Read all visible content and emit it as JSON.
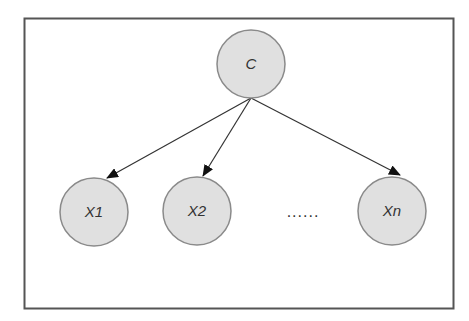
{
  "diagram": {
    "type": "bayesian-network",
    "nodes": [
      {
        "id": "C",
        "label": "C",
        "role": "parent"
      },
      {
        "id": "X1",
        "label": "X1",
        "role": "child"
      },
      {
        "id": "X2",
        "label": "X2",
        "role": "child"
      },
      {
        "id": "Xn",
        "label": "Xn",
        "role": "child"
      }
    ],
    "edges": [
      {
        "from": "C",
        "to": "X1"
      },
      {
        "from": "C",
        "to": "X2"
      },
      {
        "from": "C",
        "to": "Xn"
      }
    ],
    "ellipsis": "......",
    "colors": {
      "node_fill": "#e0e0e0",
      "node_stroke": "#8a8a8a",
      "edge": "#333333",
      "frame": "#555555",
      "text": "#333333"
    }
  }
}
